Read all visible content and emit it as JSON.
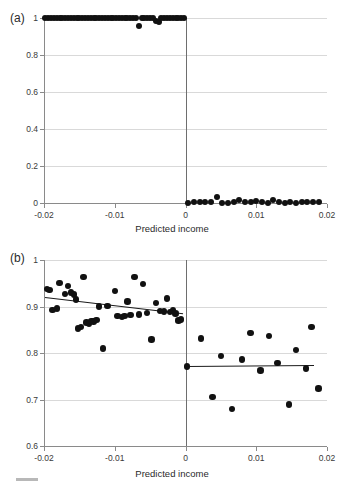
{
  "figure": {
    "panel_a_letter": "(a)",
    "panel_b_letter": "(b)",
    "xlabel": "Predicted income"
  },
  "chart_data": [
    {
      "type": "scatter",
      "panel": "(a)",
      "title": "",
      "xlabel": "Predicted income",
      "ylabel": "",
      "xlim": [
        -0.02,
        0.02
      ],
      "ylim": [
        0,
        1
      ],
      "xticks": [
        -0.02,
        -0.01,
        0,
        0.01,
        0.02
      ],
      "xticklabels": [
        "-0.02",
        "-0.01",
        "0",
        "0.01",
        "0.02"
      ],
      "yticks": [
        0,
        0.2,
        0.4,
        0.6,
        0.8,
        1
      ],
      "yticklabels": [
        "0",
        "0.2",
        "0.4",
        "0.6",
        "0.8",
        "1"
      ],
      "grid": true,
      "legend": "none",
      "cutoff": 0,
      "annotations": [
        "vertical reference line at x = 0"
      ],
      "series": [
        {
          "name": "left of cutoff",
          "x": [
            -0.0198,
            -0.0194,
            -0.019,
            -0.0186,
            -0.0182,
            -0.0178,
            -0.0174,
            -0.017,
            -0.0166,
            -0.0162,
            -0.0158,
            -0.0154,
            -0.015,
            -0.0146,
            -0.0142,
            -0.0138,
            -0.0134,
            -0.013,
            -0.0126,
            -0.0122,
            -0.0118,
            -0.0114,
            -0.011,
            -0.0106,
            -0.0102,
            -0.0098,
            -0.0094,
            -0.009,
            -0.0086,
            -0.0082,
            -0.0078,
            -0.0074,
            -0.007,
            -0.0066,
            -0.0062,
            -0.0058,
            -0.0054,
            -0.005,
            -0.0046,
            -0.0042,
            -0.0038,
            -0.0034,
            -0.003,
            -0.0026,
            -0.0022,
            -0.0018,
            -0.0014,
            -0.001,
            -0.0006,
            -0.0002
          ],
          "y": [
            1.0,
            1.0,
            1.0,
            1.0,
            1.0,
            1.0,
            1.0,
            1.0,
            1.0,
            1.0,
            1.0,
            1.0,
            1.0,
            1.0,
            1.0,
            1.0,
            1.0,
            1.0,
            1.0,
            1.0,
            1.0,
            1.0,
            1.0,
            1.0,
            1.0,
            1.0,
            1.0,
            1.0,
            1.0,
            1.0,
            1.0,
            1.0,
            1.0,
            0.955,
            1.0,
            1.0,
            1.0,
            1.0,
            1.0,
            0.982,
            0.978,
            1.0,
            1.0,
            1.0,
            1.0,
            1.0,
            1.0,
            1.0,
            1.0,
            1.0
          ]
        },
        {
          "name": "right of cutoff",
          "x": [
            0.0004,
            0.0012,
            0.002,
            0.0028,
            0.0036,
            0.0044,
            0.0052,
            0.006,
            0.0068,
            0.0076,
            0.0084,
            0.0092,
            0.01,
            0.0108,
            0.0116,
            0.0124,
            0.0132,
            0.014,
            0.0148,
            0.0156,
            0.0164,
            0.0172,
            0.018,
            0.0188
          ],
          "y": [
            0.002,
            0.004,
            0.004,
            0.008,
            0.003,
            0.03,
            0.002,
            0.002,
            0.004,
            0.016,
            0.006,
            0.003,
            0.01,
            0.003,
            0.002,
            0.016,
            0.004,
            0.002,
            0.003,
            0.002,
            0.003,
            0.003,
            0.004,
            0.003
          ]
        }
      ]
    },
    {
      "type": "scatter",
      "panel": "(b)",
      "title": "",
      "xlabel": "Predicted income",
      "ylabel": "",
      "xlim": [
        -0.02,
        0.02
      ],
      "ylim": [
        0.6,
        1.0
      ],
      "xticks": [
        -0.02,
        -0.01,
        0,
        0.01,
        0.02
      ],
      "xticklabels": [
        "-0.02",
        "-0.01",
        "0",
        "0.01",
        "0.02"
      ],
      "yticks": [
        0.6,
        0.7,
        0.8,
        0.9,
        1.0
      ],
      "yticklabels": [
        "0.6",
        "0.7",
        "0.8",
        "0.9",
        "1"
      ],
      "grid": true,
      "legend": "none",
      "cutoff": 0,
      "annotations": [
        "vertical reference line at x = 0",
        "fitted regression line left of cutoff",
        "fitted regression line right of cutoff"
      ],
      "fit_lines": [
        {
          "name": "left fit",
          "x0": -0.0198,
          "y0": 0.92,
          "x1": -0.0003,
          "y1": 0.885
        },
        {
          "name": "right fit",
          "x0": 0.0002,
          "y0": 0.771,
          "x1": 0.0182,
          "y1": 0.773
        }
      ],
      "series": [
        {
          "name": "left of cutoff",
          "x": [
            -0.0196,
            -0.0192,
            -0.0188,
            -0.0182,
            -0.0178,
            -0.017,
            -0.0166,
            -0.0162,
            -0.0158,
            -0.0155,
            -0.0152,
            -0.0148,
            -0.0144,
            -0.014,
            -0.0136,
            -0.0133,
            -0.013,
            -0.0126,
            -0.0122,
            -0.0117,
            -0.011,
            -0.01,
            -0.0096,
            -0.009,
            -0.0086,
            -0.0082,
            -0.0078,
            -0.0072,
            -0.0066,
            -0.006,
            -0.0054,
            -0.0048,
            -0.0042,
            -0.0036,
            -0.003,
            -0.0026,
            -0.0022,
            -0.0018,
            -0.0014,
            -0.001,
            -0.0006
          ],
          "y": [
            0.938,
            0.936,
            0.893,
            0.896,
            0.951,
            0.927,
            0.944,
            0.93,
            0.926,
            0.915,
            0.853,
            0.856,
            0.964,
            0.866,
            0.862,
            0.869,
            0.868,
            0.871,
            0.9,
            0.81,
            0.901,
            0.933,
            0.879,
            0.877,
            0.879,
            0.911,
            0.882,
            0.963,
            0.883,
            0.949,
            0.886,
            0.829,
            0.907,
            0.89,
            0.889,
            0.917,
            0.888,
            0.891,
            0.885,
            0.87,
            0.872
          ]
        },
        {
          "name": "right of cutoff",
          "x": [
            0.0002,
            0.0022,
            0.0038,
            0.005,
            0.0066,
            0.008,
            0.0092,
            0.0106,
            0.0118,
            0.013,
            0.0146,
            0.0156,
            0.017,
            0.0178,
            0.0188
          ],
          "y": [
            0.771,
            0.831,
            0.705,
            0.793,
            0.68,
            0.786,
            0.843,
            0.762,
            0.837,
            0.778,
            0.689,
            0.806,
            0.767,
            0.856,
            0.724
          ]
        }
      ]
    }
  ]
}
